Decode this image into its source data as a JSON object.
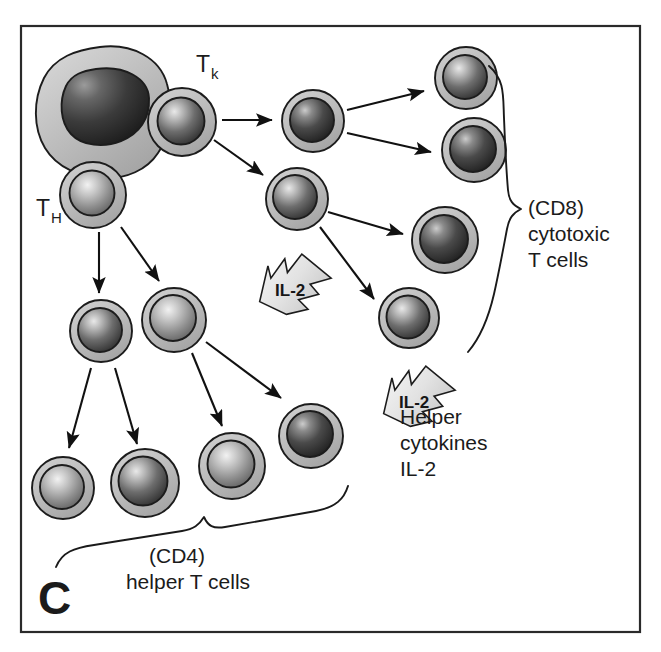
{
  "figure": {
    "panel_letter": "C",
    "background_color": "#ffffff",
    "frame_color": "#2a2a2a",
    "cytoplasm_color": "#b9b9b9",
    "nucleus_dark_color": "#3a3a3a",
    "outline_color": "#1c1c1c",
    "arrow_color": "#111111"
  },
  "labels": {
    "tk": {
      "base": "T",
      "sub": "k"
    },
    "th": {
      "base": "T",
      "sub": "H"
    },
    "cd8": [
      "(CD8)",
      "cytotoxic",
      "T cells"
    ],
    "cd4": [
      "(CD4)",
      "helper T cells"
    ],
    "cytokines": [
      "Helper",
      "cytokines",
      "IL-2"
    ],
    "il2_arrow_text": "IL-2"
  },
  "cells": {
    "apc": {
      "name": "antigen-presenting-cell",
      "cx": 100,
      "cy": 105,
      "rx": 62,
      "ry": 58
    },
    "tk_parent": {
      "name": "tk-precursor-cell",
      "cx": 182,
      "cy": 122,
      "r": 34
    },
    "th_parent": {
      "name": "th-precursor-cell",
      "cx": 93,
      "cy": 195,
      "r": 33
    },
    "tk_mid": [
      {
        "name": "tk-intermediate-upper",
        "cx": 313,
        "cy": 121,
        "r": 31
      },
      {
        "name": "tk-intermediate-lower",
        "cx": 297,
        "cy": 199,
        "r": 31
      }
    ],
    "cd8_cells": [
      {
        "name": "cd8-cytotoxic-cell-1",
        "cx": 466,
        "cy": 78,
        "r": 31
      },
      {
        "name": "cd8-cytotoxic-cell-2",
        "cx": 474,
        "cy": 150,
        "r": 32
      },
      {
        "name": "cd8-cytotoxic-cell-3",
        "cx": 445,
        "cy": 240,
        "r": 33
      },
      {
        "name": "cd8-cytotoxic-cell-4",
        "cx": 409,
        "cy": 318,
        "r": 30
      }
    ],
    "th_mid": [
      {
        "name": "th-intermediate-left",
        "cx": 101,
        "cy": 331,
        "r": 31
      },
      {
        "name": "th-intermediate-right",
        "cx": 174,
        "cy": 320,
        "r": 32
      }
    ],
    "cd4_cells": [
      {
        "name": "cd4-helper-cell-1",
        "cx": 63,
        "cy": 488,
        "r": 31
      },
      {
        "name": "cd4-helper-cell-2",
        "cx": 145,
        "cy": 483,
        "r": 34
      },
      {
        "name": "cd4-helper-cell-3",
        "cx": 232,
        "cy": 466,
        "r": 33
      },
      {
        "name": "cd4-helper-cell-4",
        "cx": 311,
        "cy": 436,
        "r": 32
      }
    ]
  },
  "arrows": [
    {
      "name": "arrow-tk-to-mid-upper",
      "x1": 222,
      "y1": 120,
      "x2": 274,
      "y2": 120
    },
    {
      "name": "arrow-tk-to-mid-lower",
      "x1": 216,
      "y1": 141,
      "x2": 265,
      "y2": 176
    },
    {
      "name": "arrow-mid-upper-to-cd8-1",
      "x1": 347,
      "y1": 110,
      "x2": 426,
      "y2": 90
    },
    {
      "name": "arrow-mid-upper-to-cd8-2",
      "x1": 347,
      "y1": 133,
      "x2": 433,
      "y2": 153
    },
    {
      "name": "arrow-mid-lower-to-cd8-3",
      "x1": 328,
      "y1": 212,
      "x2": 405,
      "y2": 235
    },
    {
      "name": "arrow-mid-lower-to-cd8-4",
      "x1": 322,
      "y1": 228,
      "x2": 375,
      "y2": 300
    },
    {
      "name": "arrow-th-to-mid-left",
      "x1": 99,
      "y1": 232,
      "x2": 99,
      "y2": 295
    },
    {
      "name": "arrow-th-to-mid-right",
      "x1": 122,
      "y1": 228,
      "x2": 160,
      "y2": 283
    },
    {
      "name": "arrow-mid-left-to-cd4-1",
      "x1": 90,
      "y1": 368,
      "x2": 68,
      "y2": 450
    },
    {
      "name": "arrow-mid-left-to-cd4-2",
      "x1": 116,
      "y1": 368,
      "x2": 138,
      "y2": 446
    },
    {
      "name": "arrow-mid-right-to-cd4-3",
      "x1": 192,
      "y1": 353,
      "x2": 223,
      "y2": 428
    },
    {
      "name": "arrow-mid-right-to-cd4-4",
      "x1": 207,
      "y1": 343,
      "x2": 283,
      "y2": 400
    }
  ],
  "il2_arrows": [
    {
      "name": "il2-signal-arrow-upper",
      "x": 248,
      "y": 283,
      "rotate": -32
    },
    {
      "name": "il2-signal-arrow-lower",
      "x": 372,
      "y": 395,
      "rotate": -32
    }
  ]
}
